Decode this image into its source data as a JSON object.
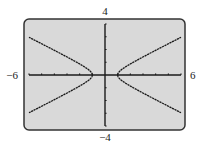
{
  "chart_data": {
    "type": "line",
    "title": "",
    "xlabel": "",
    "ylabel": "",
    "xlim": [
      -6,
      6
    ],
    "ylim": [
      -4,
      4
    ],
    "x_tick_step": 1,
    "y_tick_step": 1,
    "window_labels": {
      "xmin": "−6",
      "xmax": "6",
      "ymin": "−4",
      "ymax": "4"
    },
    "grid": false,
    "legend": "none",
    "equation": "x^2 - 4y^2 = 1",
    "series": [
      {
        "name": "right-upper-branch",
        "points": [
          [
            1,
            0
          ],
          [
            1.05,
            0.16
          ],
          [
            1.2,
            0.33
          ],
          [
            1.5,
            0.56
          ],
          [
            2,
            0.87
          ],
          [
            3,
            1.41
          ],
          [
            4,
            1.94
          ],
          [
            5,
            2.45
          ],
          [
            6,
            2.96
          ]
        ]
      },
      {
        "name": "right-lower-branch",
        "points": [
          [
            1,
            0
          ],
          [
            1.05,
            -0.16
          ],
          [
            1.2,
            -0.33
          ],
          [
            1.5,
            -0.56
          ],
          [
            2,
            -0.87
          ],
          [
            3,
            -1.41
          ],
          [
            4,
            -1.94
          ],
          [
            5,
            -2.45
          ],
          [
            6,
            -2.96
          ]
        ]
      },
      {
        "name": "left-upper-branch",
        "points": [
          [
            -1,
            0
          ],
          [
            -1.05,
            0.16
          ],
          [
            -1.2,
            0.33
          ],
          [
            -1.5,
            0.56
          ],
          [
            -2,
            0.87
          ],
          [
            -3,
            1.41
          ],
          [
            -4,
            1.94
          ],
          [
            -5,
            2.45
          ],
          [
            -6,
            2.96
          ]
        ]
      },
      {
        "name": "left-lower-branch",
        "points": [
          [
            -1,
            0
          ],
          [
            -1.05,
            -0.16
          ],
          [
            -1.2,
            -0.33
          ],
          [
            -1.5,
            -0.56
          ],
          [
            -2,
            -0.87
          ],
          [
            -3,
            -1.41
          ],
          [
            -4,
            -1.94
          ],
          [
            -5,
            -2.45
          ],
          [
            -6,
            -2.96
          ]
        ]
      }
    ],
    "colors": {
      "screen": "#d9d9d9",
      "frame": "#333333",
      "curve": "#1a1a1a",
      "axis": "#1a1a1a"
    }
  }
}
